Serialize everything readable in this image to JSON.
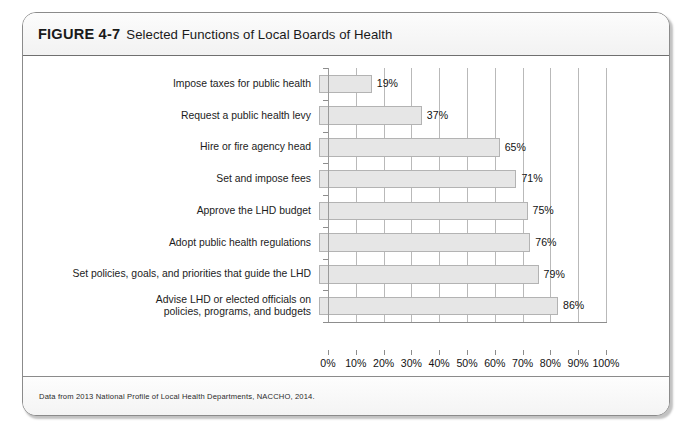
{
  "figure": {
    "number": "FIGURE 4-7",
    "caption": "Selected Functions of Local Boards of Health",
    "source_note": "Data from 2013 National Profile of Local Health Departments, NACCHO, 2014."
  },
  "chart_data": {
    "type": "bar",
    "orientation": "horizontal",
    "title": "Selected Functions of Local Boards of Health",
    "xlabel": "",
    "ylabel": "",
    "xlim": [
      0,
      100
    ],
    "grid": true,
    "legend": false,
    "tick_labels": [
      "0%",
      "10%",
      "20%",
      "30%",
      "40%",
      "50%",
      "60%",
      "70%",
      "80%",
      "90%",
      "100%"
    ],
    "tick_values": [
      0,
      10,
      20,
      30,
      40,
      50,
      60,
      70,
      80,
      90,
      100
    ],
    "categories": [
      "Impose taxes for public health",
      "Request a public health levy",
      "Hire or fire agency head",
      "Set and impose fees",
      "Approve the LHD budget",
      "Adopt public health regulations",
      "Set policies, goals, and priorities that guide the LHD",
      "Advise LHD or elected officials on policies, programs, and budgets"
    ],
    "values": [
      19,
      37,
      65,
      71,
      75,
      76,
      79,
      86
    ],
    "data_labels": [
      "19%",
      "37%",
      "65%",
      "71%",
      "75%",
      "76%",
      "79%",
      "86%"
    ],
    "bar_fill": "#e6e6e6",
    "bar_edge": "#b3b3b3",
    "gridline_color": "#b9b9b9"
  },
  "bars": [
    {
      "label_line1": "Impose taxes for public health",
      "label_line2": "",
      "value": 19,
      "data_label": "19%"
    },
    {
      "label_line1": "Request a public health levy",
      "label_line2": "",
      "value": 37,
      "data_label": "37%"
    },
    {
      "label_line1": "Hire or fire agency head",
      "label_line2": "",
      "value": 65,
      "data_label": "65%"
    },
    {
      "label_line1": "Set and impose fees",
      "label_line2": "",
      "value": 71,
      "data_label": "71%"
    },
    {
      "label_line1": "Approve the LHD budget",
      "label_line2": "",
      "value": 75,
      "data_label": "75%"
    },
    {
      "label_line1": "Adopt public health regulations",
      "label_line2": "",
      "value": 76,
      "data_label": "76%"
    },
    {
      "label_line1": "Set policies, goals, and priorities that guide the LHD",
      "label_line2": "",
      "value": 79,
      "data_label": "79%"
    },
    {
      "label_line1": "Advise LHD or elected officials on",
      "label_line2": "policies, programs, and budgets",
      "value": 86,
      "data_label": "86%"
    }
  ]
}
